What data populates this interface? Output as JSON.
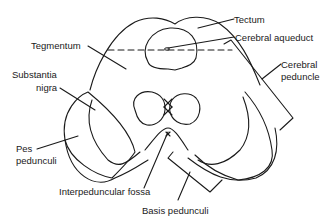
{
  "diagram": {
    "type": "anatomical-line-drawing",
    "labels": {
      "tectum": "Tectum",
      "cerebral_aqueduct": "Cerebral aqueduct",
      "tegmentum": "Tegmentum",
      "substantia_nigra_1": "Substantia",
      "substantia_nigra_2": "nigra",
      "cerebral_peduncle_1": "Cerebral",
      "cerebral_peduncle_2": "peduncle",
      "pes_pedunculi_1": "Pes",
      "pes_pedunculi_2": "pedunculi",
      "interpeduncular_fossa": "Interpeduncular fossa",
      "basis_pedunculi": "Basis pedunculi"
    },
    "colors": {
      "line": "#1a1a1a",
      "background": "#ffffff"
    }
  }
}
